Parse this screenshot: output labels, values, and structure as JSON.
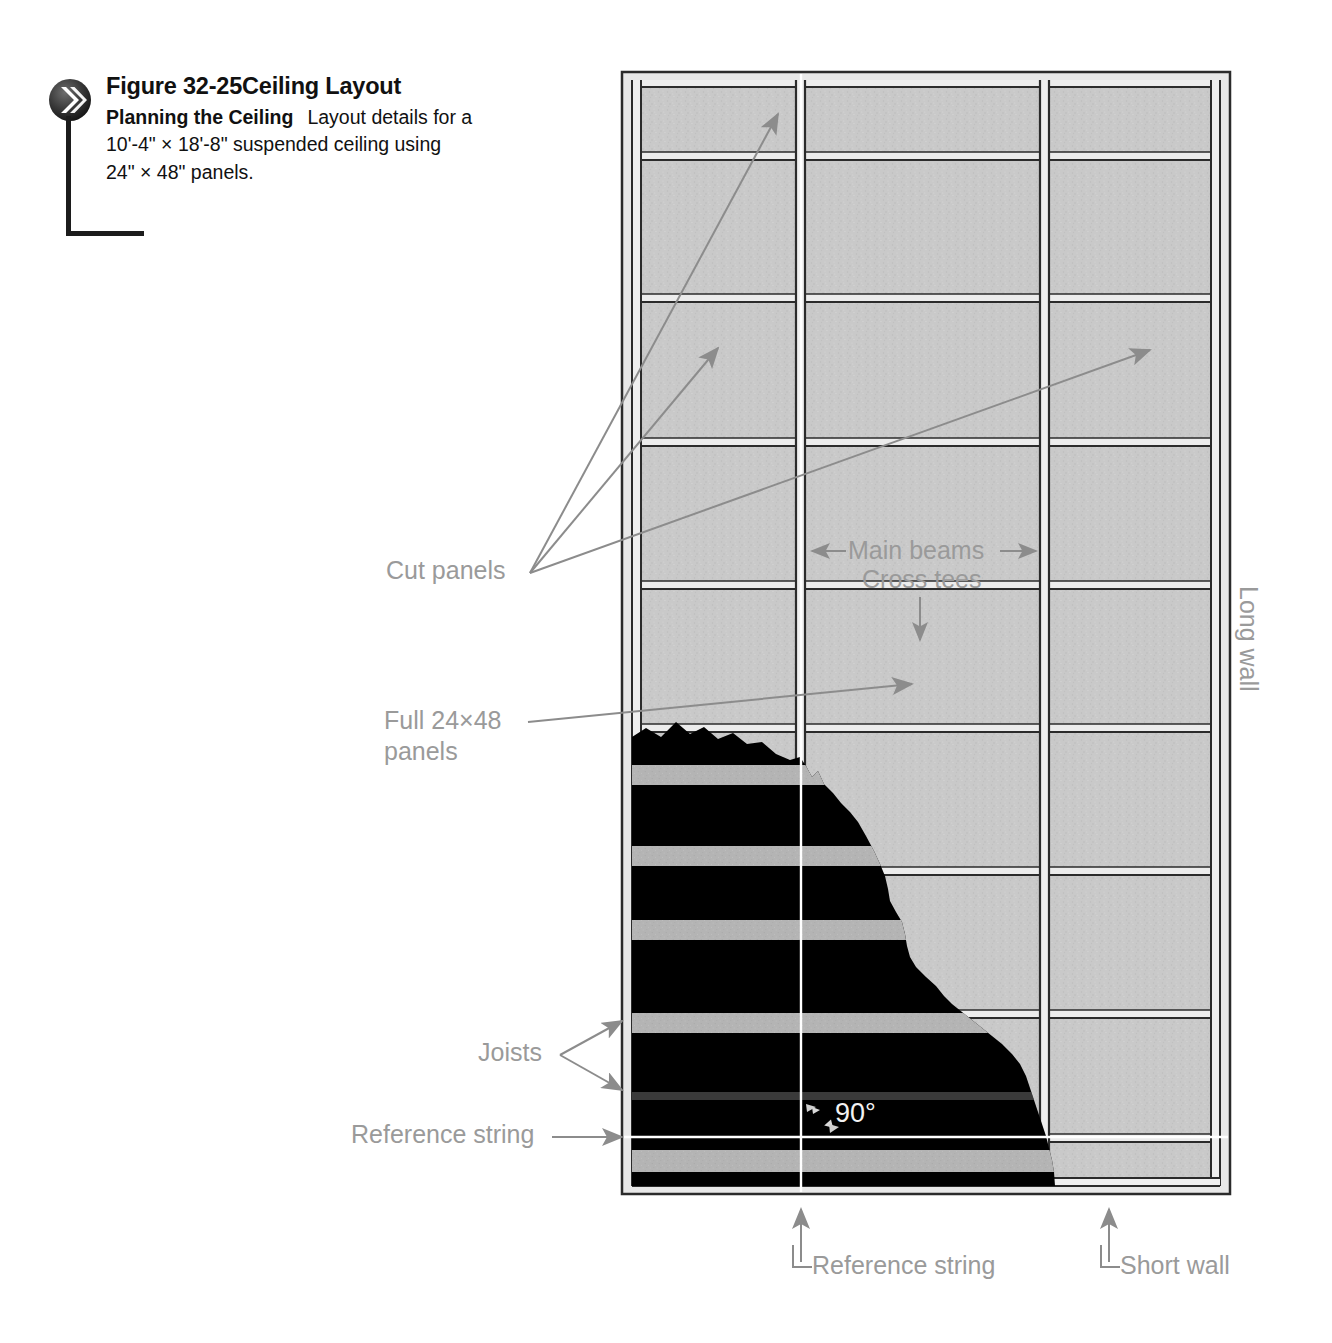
{
  "figure": {
    "bullet_icon": "chevron-double-right-icon",
    "number": "Figure 32-25",
    "title": "Ceiling Layout",
    "subtitle": "Planning the Ceiling",
    "description_line1": "Layout details for a",
    "description_line2": "10'-4\"  ×  18'-8\" suspended ceiling using",
    "description_line3": "24\"  ×  48\" panels."
  },
  "dimensions": {
    "room_width": "10'-4\"",
    "room_length": "18'-8\"",
    "panel_size": "24\" × 48\""
  },
  "labels": {
    "cut_panels": "Cut panels",
    "main_beams": "Main beams",
    "cross_tees": "Cross tees",
    "full_panels_line1": "Full 24×48",
    "full_panels_line2": "panels",
    "joists": "Joists",
    "reference_string_left": "Reference string",
    "reference_string_bottom": "Reference string",
    "short_wall": "Short wall",
    "long_wall": "Long wall",
    "angle": "90°"
  },
  "colors": {
    "panel_fill": "#c9c9c9",
    "grid_line": "#2b2b2b",
    "tee_highlight": "#e8e8e8",
    "joist_cavity": "#000000",
    "joist_band": "#b4b4b4",
    "label_gray": "#9a9a9a",
    "leader_gray": "#8c8c8c",
    "reference_string": "#ffffff",
    "caption_black": "#1c1c1c"
  },
  "grid": {
    "columns": [
      {
        "name": "cut-column-left",
        "type": "cut"
      },
      {
        "name": "full-column-center",
        "type": "full"
      },
      {
        "name": "cut-column-right",
        "type": "cut"
      }
    ],
    "cross_tee_count": 8,
    "main_beam_count": 2,
    "joist_band_count": 6
  }
}
